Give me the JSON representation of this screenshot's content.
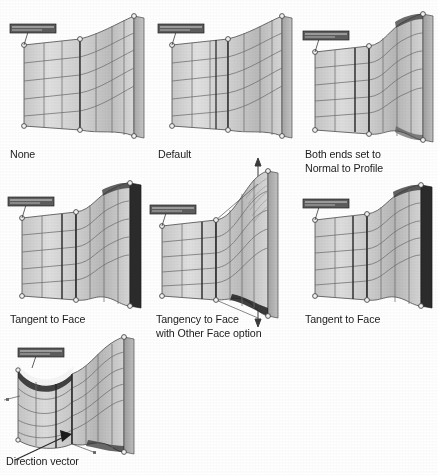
{
  "figure": {
    "title_text_present": false,
    "background_color": "#ffffff",
    "ink_color": "#1c1c1c"
  },
  "palette": {
    "surface_light": "#dcdcdc",
    "surface_mid": "#c4c4c4",
    "surface_dark": "#9a9a9a",
    "edge_band": "#b0b0b0",
    "edge_band_dark": "#2a2a2a",
    "grid_line": "#6d6d6d",
    "outline": "#3a3a3a",
    "vertex_fill": "#f2f2f2",
    "callout_fill": "#5d5d5d",
    "callout_border": "#2b2b2b"
  },
  "panels": [
    {
      "id": "none",
      "caption": "None",
      "callout_label": "End Constraint",
      "end_condition": "none",
      "left_profile_shape": "flat",
      "right_profile_shape": "flat",
      "has_direction_arrows": false,
      "right_band_tone": "light",
      "grid_u_count": 6,
      "grid_v_count": 5
    },
    {
      "id": "default",
      "caption": "Default",
      "callout_label": "End Constraint",
      "end_condition": "default",
      "left_profile_shape": "flat",
      "right_profile_shape": "flat",
      "has_direction_arrows": false,
      "right_band_tone": "light",
      "grid_u_count": 6,
      "grid_v_count": 5
    },
    {
      "id": "both-ends-normal-to-profile",
      "caption": "Both ends set to\nNormal to Profile",
      "callout_label": "End Constraint",
      "end_condition": "normal-to-profile",
      "left_profile_shape": "flat",
      "right_profile_shape": "s-curve",
      "has_direction_arrows": false,
      "right_band_tone": "light",
      "grid_u_count": 6,
      "grid_v_count": 5
    },
    {
      "id": "tangent-to-face-left",
      "caption": "Tangent to Face",
      "callout_label": "End Constraint",
      "end_condition": "tangent-to-face",
      "left_profile_shape": "flat",
      "right_profile_shape": "s-curve",
      "has_direction_arrows": false,
      "right_band_tone": "dark",
      "grid_u_count": 6,
      "grid_v_count": 5
    },
    {
      "id": "tangency-other-face-option",
      "caption": "Tangency to Face\nwith Other Face option",
      "callout_label": "End Constraint",
      "end_condition": "tangency-other-face",
      "left_profile_shape": "flat",
      "right_profile_shape": "flared",
      "has_direction_arrows": true,
      "right_band_tone": "light",
      "grid_u_count": 6,
      "grid_v_count": 5
    },
    {
      "id": "tangent-to-face-right",
      "caption": "Tangent to Face",
      "callout_label": "End Constraint",
      "end_condition": "tangent-to-face",
      "left_profile_shape": "flat",
      "right_profile_shape": "s-curve",
      "has_direction_arrows": false,
      "right_band_tone": "dark",
      "grid_u_count": 6,
      "grid_v_count": 5
    },
    {
      "id": "direction-vector",
      "caption": "Direction vector",
      "callout_label": "End Constraint",
      "end_condition": "direction-vector",
      "left_profile_shape": "scooped",
      "right_profile_shape": "s-curve",
      "has_direction_arrows": false,
      "has_leader_arrow": true,
      "right_band_tone": "light",
      "grid_u_count": 5,
      "grid_v_count": 5
    }
  ]
}
